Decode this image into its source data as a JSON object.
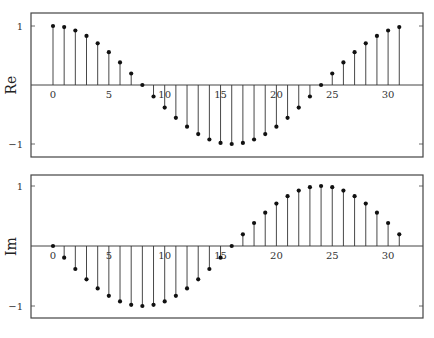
{
  "chart_data": [
    {
      "type": "stem",
      "ylabel": "Re",
      "xlabel": "",
      "x": [
        0,
        1,
        2,
        3,
        4,
        5,
        6,
        7,
        8,
        9,
        10,
        11,
        12,
        13,
        14,
        15,
        16,
        17,
        18,
        19,
        20,
        21,
        22,
        23,
        24,
        25,
        26,
        27,
        28,
        29,
        30,
        31
      ],
      "values": [
        1.0,
        0.981,
        0.924,
        0.831,
        0.707,
        0.556,
        0.383,
        0.195,
        0.0,
        -0.195,
        -0.383,
        -0.556,
        -0.707,
        -0.831,
        -0.924,
        -0.981,
        -1.0,
        -0.981,
        -0.924,
        -0.831,
        -0.707,
        -0.556,
        -0.383,
        -0.195,
        0.0,
        0.195,
        0.383,
        0.556,
        0.707,
        0.831,
        0.924,
        0.981
      ],
      "xticks": [
        "0",
        "5",
        "10",
        "15",
        "20",
        "25",
        "30"
      ],
      "yticks": [
        "1",
        "−1"
      ],
      "ylim": [
        -1.2,
        1.2
      ],
      "xlim": [
        -1.5,
        33
      ],
      "grid": false
    },
    {
      "type": "stem",
      "ylabel": "Im",
      "xlabel": "",
      "x": [
        0,
        1,
        2,
        3,
        4,
        5,
        6,
        7,
        8,
        9,
        10,
        11,
        12,
        13,
        14,
        15,
        16,
        17,
        18,
        19,
        20,
        21,
        22,
        23,
        24,
        25,
        26,
        27,
        28,
        29,
        30,
        31
      ],
      "values": [
        0.0,
        -0.195,
        -0.383,
        -0.556,
        -0.707,
        -0.831,
        -0.924,
        -0.981,
        -1.0,
        -0.981,
        -0.924,
        -0.831,
        -0.707,
        -0.556,
        -0.383,
        -0.195,
        0.0,
        0.195,
        0.383,
        0.556,
        0.707,
        0.831,
        0.924,
        0.981,
        1.0,
        0.981,
        0.924,
        0.831,
        0.707,
        0.556,
        0.383,
        0.195
      ],
      "xticks": [
        "0",
        "5",
        "10",
        "15",
        "20",
        "25",
        "30"
      ],
      "yticks": [
        "1",
        "−1"
      ],
      "ylim": [
        -1.2,
        1.2
      ],
      "xlim": [
        -1.5,
        33
      ],
      "grid": false
    }
  ],
  "colors": {
    "stem": "#333333",
    "marker": "#111111",
    "frame": "#444444",
    "text": "#333333"
  }
}
